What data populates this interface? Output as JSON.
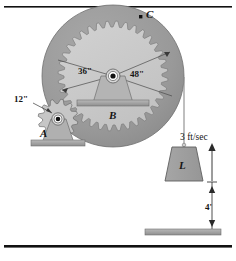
{
  "figure": {
    "background_color": "#ffffff",
    "border_color": "#000000"
  },
  "colors": {
    "outer_disc": "#9a9a9a",
    "outer_disc_edge": "#6f6f6f",
    "inner_gear": "#c9c9c9",
    "inner_gear_edge": "#7d7d7d",
    "small_gear": "#c2c2c2",
    "support": "#b4b4b4",
    "base_plate": "#a5a5a5",
    "load_body": "#9e9e9e",
    "ground_plate": "#a8a8a8",
    "line": "#2a2a2a",
    "text": "#161616"
  },
  "labels": {
    "point_c": "C",
    "gear_b": "B",
    "gear_a": "A",
    "load": "L",
    "radius_inner": "36\"",
    "radius_outer": "48\"",
    "radius_small_gear": "12\"",
    "velocity": "3 ft/sec",
    "height": "4'"
  },
  "geometry": {
    "big_center_x": 113,
    "big_center_y": 76,
    "outer_radius": 71,
    "inner_gear_radius": 55,
    "inner_gear_teeth": 36,
    "small_center_x": 58,
    "small_center_y": 119,
    "small_radius": 20,
    "small_gear_teeth": 12,
    "cable_x": 184,
    "cable_top_y": 77,
    "cable_bottom_y": 147,
    "load_top_y": 147,
    "load_bottom_y": 181,
    "ground_y": 231
  },
  "chart_data": {
    "type": "diagram",
    "annotations": [
      {
        "name": "point-c",
        "label": "C",
        "description": "marked point on outer rim of disc"
      },
      {
        "name": "gear-b-label",
        "label": "B",
        "description": "large compound gear"
      },
      {
        "name": "gear-a-label",
        "label": "A",
        "description": "small driving gear"
      },
      {
        "name": "load-label",
        "label": "L",
        "description": "hanging load block"
      },
      {
        "name": "inner-radius",
        "label": "36\"",
        "value": 36,
        "unit": "in"
      },
      {
        "name": "outer-radius",
        "label": "48\"",
        "value": 48,
        "unit": "in"
      },
      {
        "name": "small-gear-radius",
        "label": "12\"",
        "value": 12,
        "unit": "in"
      },
      {
        "name": "load-velocity",
        "label": "3 ft/sec",
        "value": 3,
        "unit": "ft/sec",
        "direction": "up"
      },
      {
        "name": "load-height",
        "label": "4'",
        "value": 4,
        "unit": "ft"
      }
    ]
  }
}
